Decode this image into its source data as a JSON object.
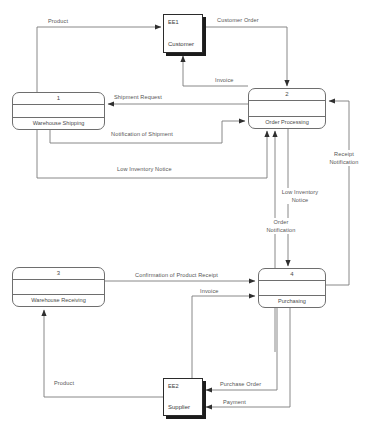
{
  "diagram": {
    "type": "data-flow-diagram",
    "title": "",
    "processes": [
      {
        "id": "1",
        "number": "1",
        "name": "Warehouse Shipping",
        "x": 12,
        "y": 92,
        "w": 93,
        "h": 38
      },
      {
        "id": "2",
        "number": "2",
        "name": "Order Processing",
        "x": 248,
        "y": 88,
        "w": 78,
        "h": 41
      },
      {
        "id": "3",
        "number": "3",
        "name": "Warehouse Receiving",
        "x": 12,
        "y": 267,
        "w": 93,
        "h": 40
      },
      {
        "id": "4",
        "number": "4",
        "name": "Purchasing",
        "x": 258,
        "y": 268,
        "w": 68,
        "h": 40
      }
    ],
    "entities": [
      {
        "id": "EE1",
        "code": "EE1",
        "name": "Customer",
        "x": 163,
        "y": 14,
        "w": 40,
        "h": 39
      },
      {
        "id": "EE2",
        "code": "EE2",
        "name": "Supplier",
        "x": 163,
        "y": 378,
        "w": 40,
        "h": 38
      }
    ],
    "flows": [
      {
        "label": "Product",
        "from": "1",
        "to": "EE1",
        "lx": 47,
        "ly": 18
      },
      {
        "label": "Customer Order",
        "from": "EE1",
        "to": "2",
        "lx": 216,
        "ly": 17
      },
      {
        "label": "Invoice",
        "from": "2",
        "to": "EE1",
        "lx": 214,
        "ly": 77
      },
      {
        "label": "Shipment Request",
        "from": "2",
        "to": "1",
        "lx": 113,
        "ly": 94
      },
      {
        "label": "Notification of Shipment",
        "from": "1",
        "to": "2",
        "lx": 110,
        "ly": 131
      },
      {
        "label": "Low Inventory Notice",
        "from": "1",
        "to": "2",
        "lx": 116,
        "ly": 166
      },
      {
        "label": "Receipt Notification",
        "from": "4",
        "to": "2",
        "lx": 326,
        "ly": 152
      },
      {
        "label": "Low Inventory Notice",
        "from": "4",
        "to": "2",
        "lx": 279,
        "ly": 190
      },
      {
        "label": "Order Notification",
        "from": "2",
        "to": "4",
        "lx": 262,
        "ly": 220
      },
      {
        "label": "Confirmation of Product Receipt",
        "from": "3",
        "to": "4",
        "lx": 134,
        "ly": 272
      },
      {
        "label": "Invoice",
        "from": "EE2",
        "to": "4",
        "lx": 199,
        "ly": 288
      },
      {
        "label": "Purchase Order",
        "from": "4",
        "to": "EE2",
        "lx": 219,
        "ly": 387
      },
      {
        "label": "Payment",
        "from": "4",
        "to": "EE2",
        "lx": 222,
        "ly": 404
      },
      {
        "label": "Product",
        "from": "EE2",
        "to": "3",
        "lx": 53,
        "ly": 380
      }
    ],
    "colors": {
      "line": "#7a7a7a",
      "text": "#555555",
      "entity_border": "#2b2b2b",
      "entity_shadow": "#1c1c1c"
    }
  }
}
